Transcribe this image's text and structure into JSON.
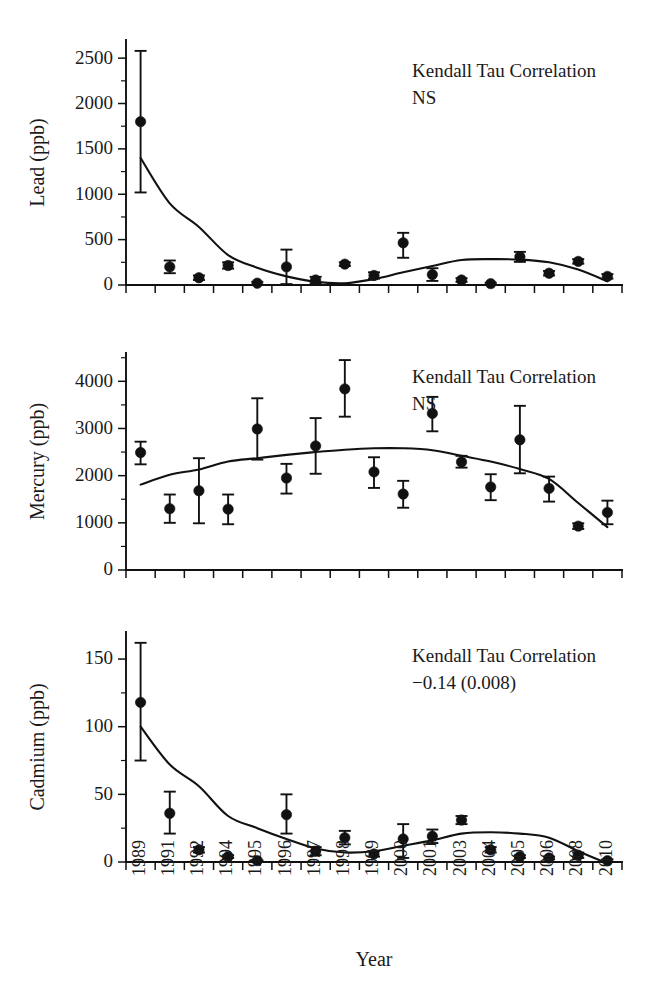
{
  "figure": {
    "xlabel": "Year",
    "background": "#ffffff",
    "ink_color": "#111111"
  },
  "chart_data": [
    {
      "type": "scatter",
      "panel": "lead",
      "title": "",
      "xlabel": "",
      "ylabel": "Lead (ppb)",
      "categories": [
        "1989",
        "1991",
        "1992",
        "1994",
        "1995",
        "1996",
        "1997",
        "1998",
        "1999",
        "2000",
        "2001",
        "2003",
        "2004",
        "2005",
        "2006",
        "2008",
        "2010"
      ],
      "values": [
        1800,
        200,
        80,
        215,
        20,
        200,
        55,
        230,
        105,
        465,
        115,
        55,
        15,
        310,
        130,
        260,
        95
      ],
      "err_low": [
        780,
        70,
        25,
        35,
        15,
        190,
        35,
        20,
        35,
        165,
        70,
        20,
        10,
        55,
        25,
        25,
        25
      ],
      "err_high": [
        780,
        70,
        25,
        35,
        15,
        190,
        35,
        20,
        35,
        110,
        70,
        20,
        10,
        55,
        25,
        25,
        25
      ],
      "fit_curve": [
        1400,
        900,
        640,
        330,
        190,
        95,
        35,
        20,
        65,
        140,
        210,
        275,
        285,
        280,
        250,
        170,
        40
      ],
      "ylim": [
        0,
        2700
      ],
      "yticks": [
        0,
        500,
        1000,
        1500,
        2000,
        2500
      ],
      "ytick_labels": [
        "0",
        "500",
        "1000",
        "1500",
        "2000",
        "2500"
      ],
      "yminor_step": 250,
      "grid": false,
      "annotation_line1": "Kendall Tau Correlation",
      "annotation_line2": "NS",
      "marker": "filled-circle",
      "errorbars": true
    },
    {
      "type": "scatter",
      "panel": "mercury",
      "title": "",
      "xlabel": "",
      "ylabel": "Mercury (ppb)",
      "categories": [
        "1989",
        "1991",
        "1992",
        "1994",
        "1995",
        "1996",
        "1997",
        "1998",
        "1999",
        "2000",
        "2001",
        "2003",
        "2004",
        "2005",
        "2006",
        "2008",
        "2010"
      ],
      "values": [
        2490,
        1300,
        1680,
        1290,
        2990,
        1950,
        2630,
        3840,
        2080,
        1610,
        3320,
        2290,
        1760,
        2760,
        1730,
        930,
        1220
      ],
      "err_low": [
        250,
        300,
        690,
        320,
        650,
        330,
        590,
        590,
        340,
        290,
        380,
        120,
        280,
        710,
        280,
        60,
        250
      ],
      "err_high": [
        230,
        300,
        690,
        310,
        650,
        300,
        590,
        610,
        310,
        280,
        350,
        130,
        270,
        720,
        250,
        60,
        250
      ],
      "fit_curve": [
        1810,
        2020,
        2130,
        2300,
        2370,
        2440,
        2500,
        2550,
        2580,
        2580,
        2540,
        2420,
        2300,
        2140,
        1930,
        1420,
        910
      ],
      "ylim": [
        0,
        4600
      ],
      "yticks": [
        0,
        1000,
        2000,
        3000,
        4000
      ],
      "ytick_labels": [
        "0",
        "1000",
        "2000",
        "3000",
        "4000"
      ],
      "yminor_step": 500,
      "grid": false,
      "annotation_line1": "Kendall Tau Correlation",
      "annotation_line2": "NS",
      "marker": "filled-circle",
      "errorbars": true
    },
    {
      "type": "scatter",
      "panel": "cadmium",
      "title": "",
      "xlabel": "",
      "ylabel": "Cadmium (ppb)",
      "categories": [
        "1989",
        "1991",
        "1992",
        "1994",
        "1995",
        "1996",
        "1997",
        "1998",
        "1999",
        "2000",
        "2001",
        "2003",
        "2004",
        "2005",
        "2006",
        "2008",
        "2010"
      ],
      "values": [
        118,
        36,
        9,
        4,
        1,
        35,
        8,
        18,
        6,
        17,
        19,
        31,
        9,
        4,
        3,
        5,
        1
      ],
      "err_low": [
        43,
        15,
        2,
        1,
        0,
        14,
        3,
        5,
        2,
        14,
        5,
        3,
        2,
        1,
        1,
        2,
        1
      ],
      "err_high": [
        44,
        16,
        2,
        1,
        0,
        15,
        3,
        5,
        2,
        11,
        5,
        3,
        2,
        1,
        1,
        2,
        1
      ],
      "fit_curve": [
        100,
        72,
        56,
        34,
        25,
        17,
        10,
        7,
        8,
        12,
        16,
        21,
        22,
        21,
        18,
        8,
        -1
      ],
      "ylim": [
        0,
        170
      ],
      "yticks": [
        0,
        50,
        100,
        150
      ],
      "ytick_labels": [
        "0",
        "50",
        "100",
        "150"
      ],
      "yminor_step": 25,
      "grid": false,
      "annotation_line1": "Kendall Tau Correlation",
      "annotation_line2": "−0.14 (0.008)",
      "marker": "filled-circle",
      "errorbars": true
    }
  ]
}
